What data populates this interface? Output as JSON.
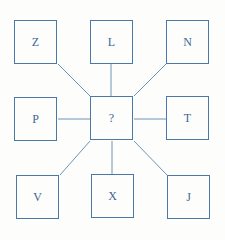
{
  "diagram": {
    "type": "hub-and-spoke letter puzzle",
    "center": {
      "label": "?"
    },
    "outer": [
      {
        "position": "top-left",
        "label": "Z"
      },
      {
        "position": "top",
        "label": "L"
      },
      {
        "position": "top-right",
        "label": "N"
      },
      {
        "position": "left",
        "label": "P"
      },
      {
        "position": "right",
        "label": "T"
      },
      {
        "position": "bottom-left",
        "label": "V"
      },
      {
        "position": "bottom",
        "label": "X"
      },
      {
        "position": "bottom-right",
        "label": "J"
      }
    ],
    "colors": {
      "stroke": "#4a78a8",
      "text": "#3d6796",
      "background": "#fdfdfb"
    }
  }
}
